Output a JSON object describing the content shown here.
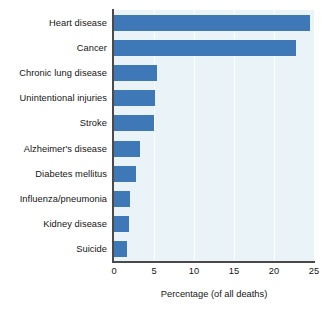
{
  "chart_data": {
    "type": "bar",
    "orientation": "horizontal",
    "title": "",
    "xlabel": "Percentage (of all deaths)",
    "ylabel": "",
    "xlim": [
      0,
      25
    ],
    "xticks": [
      0,
      5,
      10,
      15,
      20,
      25
    ],
    "grid": true,
    "legend": null,
    "categories": [
      "Heart disease",
      "Cancer",
      "Chronic lung disease",
      "Unintentional injuries",
      "Stroke",
      "Alzheimer's disease",
      "Diabetes mellitus",
      "Influenza/pneumonia",
      "Kidney disease",
      "Suicide"
    ],
    "values": [
      24.5,
      22.8,
      5.4,
      5.1,
      5.0,
      3.3,
      2.8,
      2.0,
      1.9,
      1.6
    ],
    "bar_color": "#3f78b6",
    "plot_background": "#eaf4f8",
    "axis_color": "#4a4a4a",
    "gridline_color": "#ffffff"
  }
}
